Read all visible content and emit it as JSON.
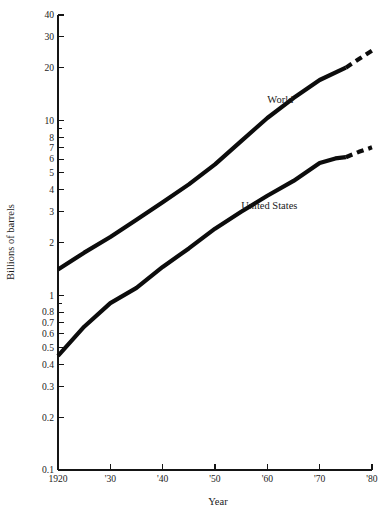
{
  "chart_data": {
    "type": "line",
    "title": "",
    "xlabel": "Year",
    "ylabel": "Billions of barrels",
    "yscale": "log",
    "ylim": [
      0.1,
      40
    ],
    "xlim": [
      1920,
      1980
    ],
    "grid": false,
    "legend_position": "inline-annotation",
    "y_ticks": [
      {
        "value": 40,
        "label": "40"
      },
      {
        "value": 30,
        "label": "30"
      },
      {
        "value": 20,
        "label": "20"
      },
      {
        "value": 10,
        "label": "10"
      },
      {
        "value": 9,
        "label": ""
      },
      {
        "value": 8,
        "label": "8"
      },
      {
        "value": 7,
        "label": "7"
      },
      {
        "value": 6,
        "label": "6"
      },
      {
        "value": 5,
        "label": "5"
      },
      {
        "value": 4,
        "label": "4"
      },
      {
        "value": 3,
        "label": "3"
      },
      {
        "value": 2,
        "label": "2"
      },
      {
        "value": 1,
        "label": "1"
      },
      {
        "value": 0.9,
        "label": ""
      },
      {
        "value": 0.8,
        "label": "0.8"
      },
      {
        "value": 0.7,
        "label": "0.7"
      },
      {
        "value": 0.6,
        "label": "0.6"
      },
      {
        "value": 0.5,
        "label": "0.5"
      },
      {
        "value": 0.4,
        "label": "0.4"
      },
      {
        "value": 0.3,
        "label": "0.3"
      },
      {
        "value": 0.2,
        "label": "0.2"
      },
      {
        "value": 0.1,
        "label": "0.1"
      }
    ],
    "x_ticks": [
      {
        "value": 1920,
        "label": "1920"
      },
      {
        "value": 1930,
        "label": "'30"
      },
      {
        "value": 1940,
        "label": "'40"
      },
      {
        "value": 1950,
        "label": "'50"
      },
      {
        "value": 1960,
        "label": "'60"
      },
      {
        "value": 1970,
        "label": "'70"
      },
      {
        "value": 1980,
        "label": "'80"
      }
    ],
    "series": [
      {
        "name": "World",
        "label": "World",
        "label_x": 1960,
        "label_y": 12.5,
        "color": "#0c0c0c",
        "solid": {
          "x": [
            1920,
            1925,
            1930,
            1935,
            1940,
            1945,
            1950,
            1955,
            1960,
            1965,
            1970,
            1975
          ],
          "y": [
            1.4,
            1.75,
            2.15,
            2.7,
            3.4,
            4.3,
            5.6,
            7.6,
            10.3,
            13.4,
            17.0,
            20.0
          ]
        },
        "projected": {
          "x": [
            1975,
            1977.5,
            1980
          ],
          "y": [
            20.0,
            22.4,
            25.0
          ],
          "style": "dashed"
        }
      },
      {
        "name": "United States",
        "label": "United States",
        "label_x": 1955,
        "label_y": 3.1,
        "color": "#0c0c0c",
        "solid": {
          "x": [
            1920,
            1925,
            1930,
            1935,
            1940,
            1945,
            1950,
            1955,
            1960,
            1965,
            1970,
            1973,
            1975
          ],
          "y": [
            0.45,
            0.66,
            0.9,
            1.1,
            1.45,
            1.85,
            2.4,
            3.0,
            3.7,
            4.5,
            5.7,
            6.05,
            6.15
          ]
        },
        "projected": {
          "x": [
            1975,
            1977.5,
            1980
          ],
          "y": [
            6.15,
            6.6,
            7.0
          ],
          "style": "dashed"
        }
      }
    ]
  }
}
